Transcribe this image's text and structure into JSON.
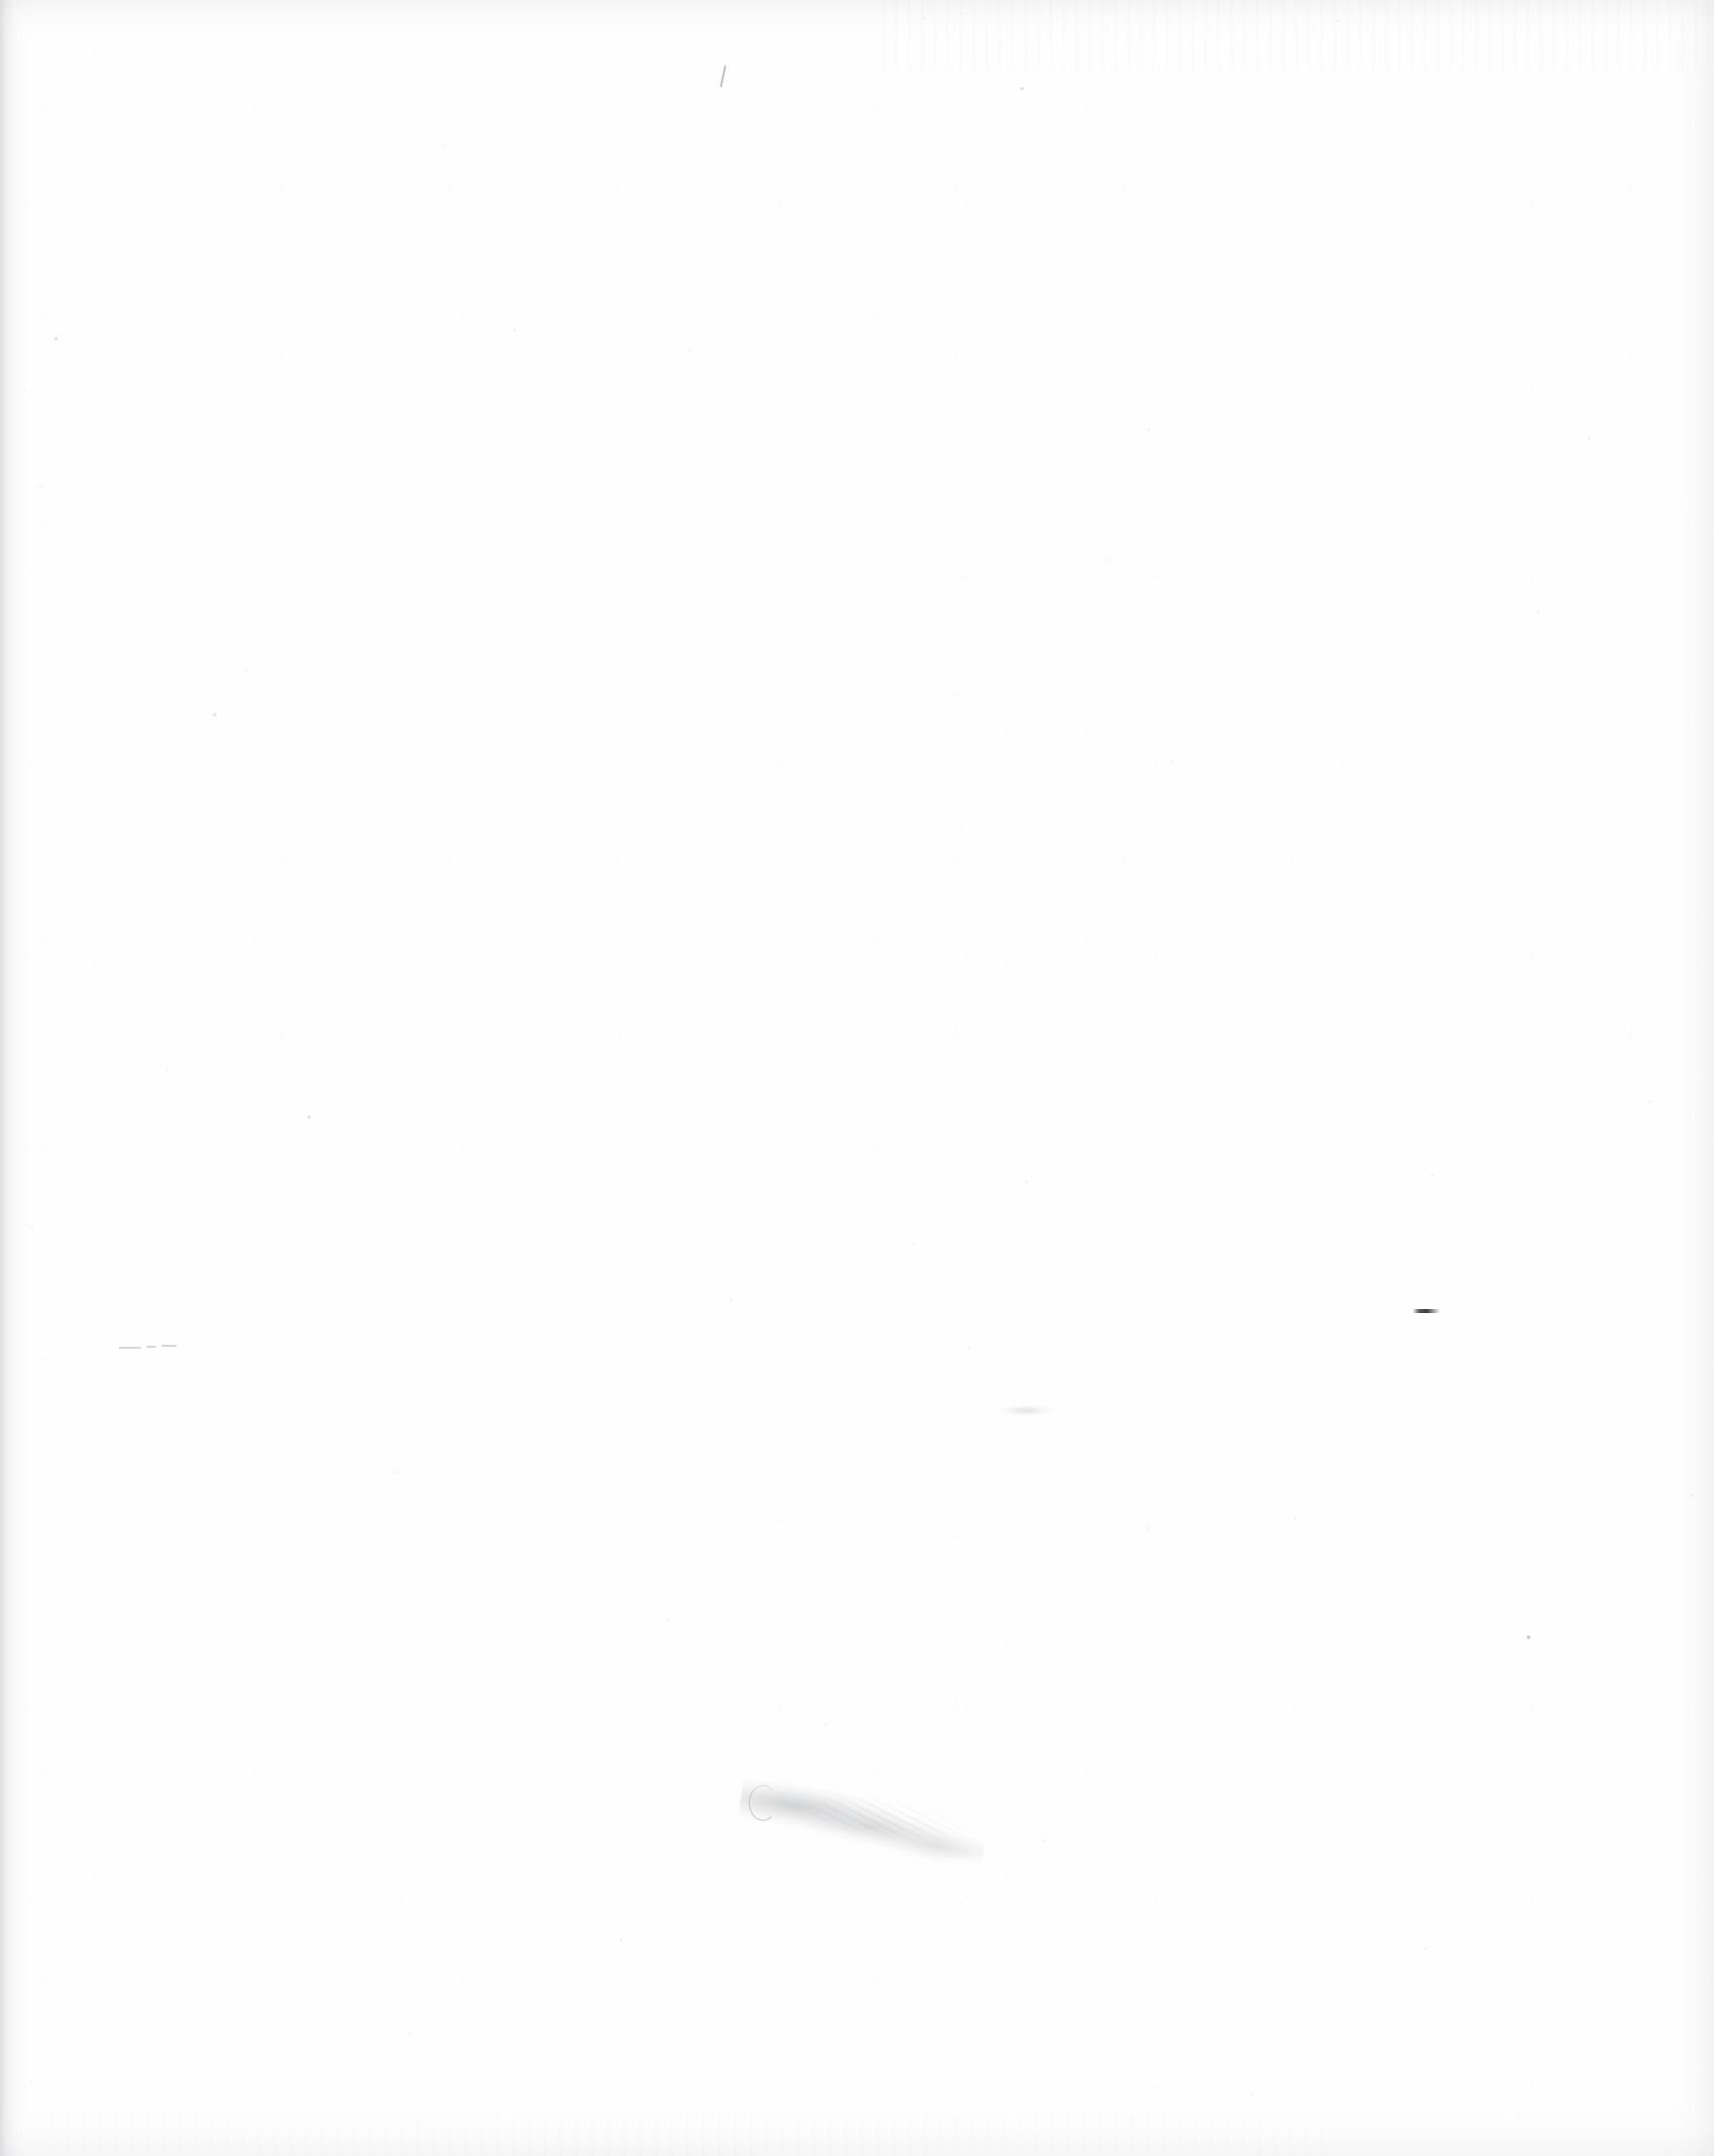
{
  "document": {
    "kind": "scanned-page",
    "content_state": "blank",
    "visible_text": "",
    "page_width_px": 1728,
    "page_height_px": 2174,
    "paper_color": "#ffffff",
    "paper_tint": "#fefefe",
    "backdrop_color": "#6e6e6e",
    "description_label": ""
  },
  "artifacts": {
    "edge_shadows": [
      {
        "name": "left-edge-shadow",
        "side": "left",
        "thickness_px": 34,
        "color": "#96989c"
      },
      {
        "name": "right-edge-shadow",
        "side": "right",
        "thickness_px": 56,
        "color": "#babcc0"
      },
      {
        "name": "top-edge-shadow",
        "side": "top",
        "thickness_px": 46,
        "color": "#c4c6ca"
      },
      {
        "name": "bottom-edge-shadow",
        "side": "bottom",
        "thickness_px": 60,
        "color": "#c6c8cc"
      }
    ],
    "streaks": [
      {
        "name": "top-right-scan-streaks",
        "x": 880,
        "y": 0,
        "width": 848,
        "height": 70,
        "color": "#ced0d4"
      },
      {
        "name": "bottom-left-scan-streaks",
        "x": 40,
        "y": 2132,
        "width": 1300,
        "height": 42,
        "color": "#d4d5d9"
      }
    ],
    "smudge": {
      "name": "graphite-smudge",
      "x": 745,
      "y": 1795,
      "width": 250,
      "height": 80,
      "color": "#808286",
      "rotation_deg": 8
    },
    "smudge_curl": {
      "name": "graphite-curl-stroke",
      "x": 755,
      "y": 1800,
      "width": 26,
      "height": 34,
      "color": "#84868a"
    },
    "dark_dash": {
      "name": "dark-ink-dash",
      "x": 1424,
      "y": 1320,
      "width": 28,
      "height": 4,
      "color": "#2c2d30"
    },
    "pale_dashes": [
      {
        "name": "pale-dash-a",
        "x": 120,
        "y": 1358,
        "width": 22,
        "height": 2,
        "color": "#b0b2b6"
      },
      {
        "name": "pale-dash-b",
        "x": 148,
        "y": 1357,
        "width": 9,
        "height": 2,
        "color": "#b0b2b6"
      },
      {
        "name": "pale-dash-c",
        "x": 163,
        "y": 1356,
        "width": 15,
        "height": 2,
        "color": "#b0b2b6"
      }
    ],
    "pen_tick": {
      "name": "pen-tick-mark",
      "x": 728,
      "y": 66,
      "width": 2,
      "height": 22,
      "color": "#969299"
    },
    "blur_mark": {
      "name": "faint-blur-mark",
      "x": 1008,
      "y": 1412,
      "width": 54,
      "height": 26,
      "color": "#acaeb2"
    },
    "specks": [
      {
        "name": "dust-speck",
        "x": 310,
        "y": 1125,
        "size": 3
      },
      {
        "name": "dust-speck",
        "x": 1539,
        "y": 1649,
        "size": 4
      },
      {
        "name": "dust-speck",
        "x": 55,
        "y": 340,
        "size": 3
      },
      {
        "name": "dust-speck",
        "x": 447,
        "y": 146,
        "size": 2
      },
      {
        "name": "dust-speck",
        "x": 1029,
        "y": 88,
        "size": 3
      },
      {
        "name": "dust-speck",
        "x": 1348,
        "y": 20,
        "size": 2
      },
      {
        "name": "dust-speck",
        "x": 247,
        "y": 676,
        "size": 2
      },
      {
        "name": "dust-speck",
        "x": 931,
        "y": 17,
        "size": 2
      },
      {
        "name": "dust-speck",
        "x": 1117,
        "y": 564,
        "size": 2
      },
      {
        "name": "dust-speck",
        "x": 1550,
        "y": 616,
        "size": 2
      },
      {
        "name": "dust-speck",
        "x": 1180,
        "y": 767,
        "size": 2
      },
      {
        "name": "dust-speck",
        "x": 1601,
        "y": 441,
        "size": 2
      },
      {
        "name": "dust-speck",
        "x": 919,
        "y": 1254,
        "size": 2
      },
      {
        "name": "dust-speck",
        "x": 1443,
        "y": 1184,
        "size": 2
      },
      {
        "name": "dust-speck",
        "x": 736,
        "y": 1310,
        "size": 2
      },
      {
        "name": "dust-speck",
        "x": 399,
        "y": 1484,
        "size": 2
      },
      {
        "name": "dust-speck",
        "x": 1034,
        "y": 1191,
        "size": 2
      },
      {
        "name": "dust-speck",
        "x": 1304,
        "y": 1530,
        "size": 2
      },
      {
        "name": "dust-speck",
        "x": 1157,
        "y": 1540,
        "size": 2
      },
      {
        "name": "dust-speck",
        "x": 1705,
        "y": 1507,
        "size": 2
      },
      {
        "name": "dust-speck",
        "x": 168,
        "y": 1078,
        "size": 2
      },
      {
        "name": "dust-speck",
        "x": 31,
        "y": 1236,
        "size": 2
      },
      {
        "name": "dust-speck",
        "x": 673,
        "y": 1633,
        "size": 2
      },
      {
        "name": "dust-speck",
        "x": 831,
        "y": 1738,
        "size": 2
      },
      {
        "name": "dust-speck",
        "x": 1052,
        "y": 1855,
        "size": 2
      },
      {
        "name": "dust-speck",
        "x": 412,
        "y": 2049,
        "size": 2
      },
      {
        "name": "dust-speck",
        "x": 1436,
        "y": 1964,
        "size": 2
      },
      {
        "name": "dust-speck",
        "x": 1262,
        "y": 2111,
        "size": 2
      },
      {
        "name": "dust-speck",
        "x": 625,
        "y": 1955,
        "size": 2
      },
      {
        "name": "dust-speck",
        "x": 215,
        "y": 719,
        "size": 3
      },
      {
        "name": "dust-speck",
        "x": 1157,
        "y": 432,
        "size": 2
      },
      {
        "name": "dust-speck",
        "x": 518,
        "y": 332,
        "size": 2
      },
      {
        "name": "dust-speck",
        "x": 694,
        "y": 353,
        "size": 2
      },
      {
        "name": "dust-speck",
        "x": 39,
        "y": 489,
        "size": 2
      },
      {
        "name": "dust-speck",
        "x": 976,
        "y": 1359,
        "size": 2
      },
      {
        "name": "dust-speck",
        "x": 1663,
        "y": 1110,
        "size": 2
      }
    ]
  }
}
